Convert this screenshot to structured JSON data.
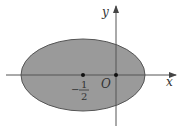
{
  "diagram": {
    "type": "ellipse-region-on-axes",
    "fill_color": "#9a9a9a",
    "stroke_color": "#555555",
    "axis_color": "#555555",
    "labels": {
      "x_axis": "x",
      "y_axis": "y",
      "origin": "O",
      "center_point_sign": "−",
      "center_point_numerator": "1",
      "center_point_denominator": "2"
    },
    "points": [
      {
        "name": "center",
        "value": "-1/2"
      },
      {
        "name": "origin",
        "value": "0"
      }
    ]
  }
}
